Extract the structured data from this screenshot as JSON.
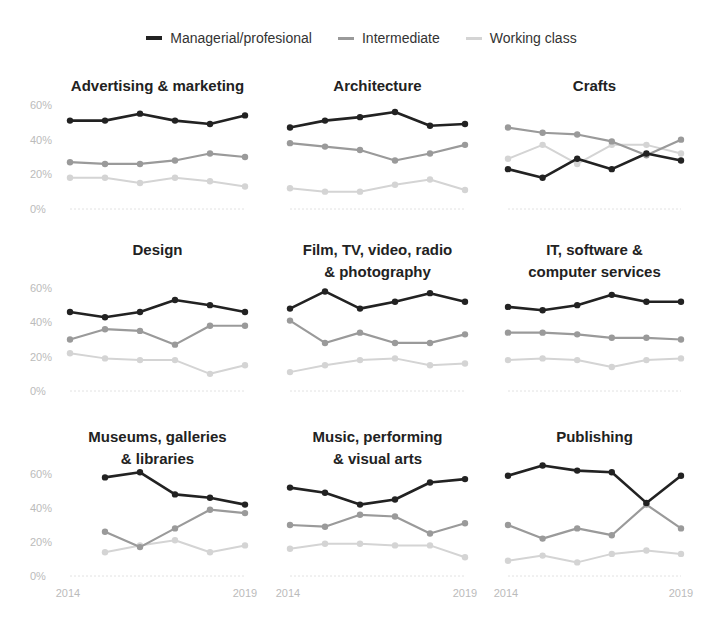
{
  "legend": [
    {
      "label": "Managerial/profesional",
      "color": "#222222"
    },
    {
      "label": "Intermediate",
      "color": "#9a9a9a"
    },
    {
      "label": "Working class",
      "color": "#d4d4d4"
    }
  ],
  "chart_data": {
    "type": "line",
    "title": "",
    "x": [
      2014,
      2015,
      2016,
      2017,
      2018,
      2019
    ],
    "xtick_labels": [
      "2014",
      "2019"
    ],
    "ytick_labels": [
      "0%",
      "20%",
      "40%",
      "60%"
    ],
    "ylim": [
      0,
      60
    ],
    "legend_position": "top",
    "grid": false,
    "panels": [
      {
        "title": [
          "Advertising & marketing"
        ],
        "series": [
          {
            "name": "Managerial/profesional",
            "values": [
              51,
              51,
              55,
              51,
              49,
              54
            ]
          },
          {
            "name": "Intermediate",
            "values": [
              27,
              26,
              26,
              28,
              32,
              30
            ]
          },
          {
            "name": "Working class",
            "values": [
              18,
              18,
              15,
              18,
              16,
              13
            ]
          }
        ]
      },
      {
        "title": [
          "Architecture"
        ],
        "series": [
          {
            "name": "Managerial/profesional",
            "values": [
              47,
              51,
              53,
              56,
              48,
              49
            ]
          },
          {
            "name": "Intermediate",
            "values": [
              38,
              36,
              34,
              28,
              32,
              37
            ]
          },
          {
            "name": "Working class",
            "values": [
              12,
              10,
              10,
              14,
              17,
              11
            ]
          }
        ]
      },
      {
        "title": [
          "Crafts"
        ],
        "series": [
          {
            "name": "Managerial/profesional",
            "values": [
              23,
              18,
              29,
              23,
              32,
              28
            ]
          },
          {
            "name": "Intermediate",
            "values": [
              47,
              44,
              43,
              39,
              31,
              40
            ]
          },
          {
            "name": "Working class",
            "values": [
              29,
              37,
              26,
              37,
              37,
              32
            ]
          }
        ]
      },
      {
        "title": [
          "Design"
        ],
        "series": [
          {
            "name": "Managerial/profesional",
            "values": [
              46,
              43,
              46,
              53,
              50,
              46
            ]
          },
          {
            "name": "Intermediate",
            "values": [
              30,
              36,
              35,
              27,
              38,
              38
            ]
          },
          {
            "name": "Working class",
            "values": [
              22,
              19,
              18,
              18,
              10,
              15
            ]
          }
        ]
      },
      {
        "title": [
          "Film, TV, video, radio",
          "& photography"
        ],
        "series": [
          {
            "name": "Managerial/profesional",
            "values": [
              48,
              58,
              48,
              52,
              57,
              52
            ]
          },
          {
            "name": "Intermediate",
            "values": [
              41,
              28,
              34,
              28,
              28,
              33
            ]
          },
          {
            "name": "Working class",
            "values": [
              11,
              15,
              18,
              19,
              15,
              16
            ]
          }
        ]
      },
      {
        "title": [
          "IT, software &",
          "computer services"
        ],
        "series": [
          {
            "name": "Managerial/profesional",
            "values": [
              49,
              47,
              50,
              56,
              52,
              52
            ]
          },
          {
            "name": "Intermediate",
            "values": [
              34,
              34,
              33,
              31,
              31,
              30
            ]
          },
          {
            "name": "Working class",
            "values": [
              18,
              19,
              18,
              14,
              18,
              19
            ]
          }
        ]
      },
      {
        "title": [
          "Museums, galleries",
          "& libraries"
        ],
        "series": [
          {
            "name": "Managerial/profesional",
            "values": [
              null,
              58,
              61,
              48,
              46,
              42
            ]
          },
          {
            "name": "Intermediate",
            "values": [
              null,
              26,
              17,
              28,
              39,
              37
            ]
          },
          {
            "name": "Working class",
            "values": [
              null,
              14,
              18,
              21,
              14,
              18
            ]
          }
        ]
      },
      {
        "title": [
          "Music, performing",
          "& visual arts"
        ],
        "series": [
          {
            "name": "Managerial/profesional",
            "values": [
              52,
              49,
              42,
              45,
              55,
              57
            ]
          },
          {
            "name": "Intermediate",
            "values": [
              30,
              29,
              36,
              35,
              25,
              31
            ]
          },
          {
            "name": "Working class",
            "values": [
              16,
              19,
              19,
              18,
              18,
              11
            ]
          }
        ]
      },
      {
        "title": [
          "Publishing"
        ],
        "series": [
          {
            "name": "Managerial/profesional",
            "values": [
              59,
              65,
              62,
              61,
              43,
              59
            ]
          },
          {
            "name": "Intermediate",
            "values": [
              30,
              22,
              28,
              24,
              42,
              28
            ]
          },
          {
            "name": "Working class",
            "values": [
              9,
              12,
              8,
              13,
              15,
              13
            ]
          }
        ]
      }
    ]
  }
}
